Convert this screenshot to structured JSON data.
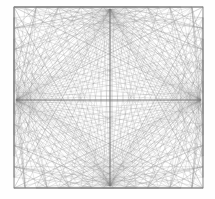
{
  "figure": {
    "type": "line-art-diagram",
    "width": 215,
    "height": 199,
    "background_color": "#fefefe"
  },
  "chart_data": {
    "type": "line",
    "xlabel": "",
    "ylabel": "",
    "grid": false,
    "legend": null,
    "xlim": [
      14,
      203
    ],
    "ylim": [
      7,
      188
    ],
    "frame": {
      "left": 14,
      "top": 7,
      "right": 203,
      "bottom": 188,
      "stroke": "#8a8a8a",
      "stroke_width": 0.9
    },
    "focal_points": [
      {
        "name": "top",
        "x": 110,
        "y": 9
      },
      {
        "name": "right",
        "x": 201,
        "y": 100
      },
      {
        "name": "bottom",
        "x": 110,
        "y": 186
      },
      {
        "name": "left",
        "x": 16,
        "y": 100
      }
    ],
    "edge_node_count_per_side": 17,
    "series": [
      {
        "name": "fan-to-top",
        "stroke": "#8c8c8c",
        "opacity": 0.5,
        "width": 0.42
      },
      {
        "name": "fan-to-right",
        "stroke": "#8c8c8c",
        "opacity": 0.5,
        "width": 0.42
      },
      {
        "name": "fan-to-bottom",
        "stroke": "#8c8c8c",
        "opacity": 0.5,
        "width": 0.42
      },
      {
        "name": "fan-to-left",
        "stroke": "#8c8c8c",
        "opacity": 0.5,
        "width": 0.42
      },
      {
        "name": "chord-mesh",
        "stroke": "#8a8a8a",
        "opacity": 0.62,
        "width": 0.5
      },
      {
        "name": "axis-horizontal",
        "stroke": "#777777",
        "opacity": 0.9,
        "width": 1.1
      },
      {
        "name": "axis-vertical",
        "stroke": "#777777",
        "opacity": 0.9,
        "width": 1.1
      }
    ],
    "colors": {
      "line": "#8a8a8a",
      "line_dark": "#707070",
      "background": "#fefefe"
    }
  }
}
